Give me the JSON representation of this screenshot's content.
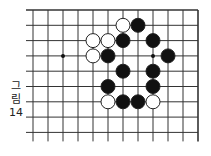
{
  "figure": {
    "caption_chars": [
      "그",
      "림",
      "14"
    ],
    "caption_label": "그림 14"
  },
  "board": {
    "cols": 12,
    "rows": 9,
    "x0": 33,
    "dx": 15,
    "y0": 10,
    "dy": 15.3,
    "top_edge": true,
    "right_edge": true,
    "line_color": "#333333",
    "hoshi": [
      {
        "col": 2,
        "row": 3
      },
      {
        "col": 8,
        "row": 3
      }
    ],
    "stones": [
      {
        "col": 6,
        "row": 1,
        "color": "white"
      },
      {
        "col": 7,
        "row": 1,
        "color": "black"
      },
      {
        "col": 4,
        "row": 2,
        "color": "white"
      },
      {
        "col": 5,
        "row": 2,
        "color": "white"
      },
      {
        "col": 6,
        "row": 2,
        "color": "black"
      },
      {
        "col": 8,
        "row": 2,
        "color": "black"
      },
      {
        "col": 4,
        "row": 3,
        "color": "white"
      },
      {
        "col": 5,
        "row": 3,
        "color": "black"
      },
      {
        "col": 9,
        "row": 3,
        "color": "black"
      },
      {
        "col": 6,
        "row": 4,
        "color": "black"
      },
      {
        "col": 8,
        "row": 4,
        "color": "black"
      },
      {
        "col": 5,
        "row": 5,
        "color": "black"
      },
      {
        "col": 8,
        "row": 5,
        "color": "black"
      },
      {
        "col": 5,
        "row": 6,
        "color": "white"
      },
      {
        "col": 6,
        "row": 6,
        "color": "black"
      },
      {
        "col": 7,
        "row": 6,
        "color": "black"
      },
      {
        "col": 8,
        "row": 6,
        "color": "white"
      }
    ]
  }
}
